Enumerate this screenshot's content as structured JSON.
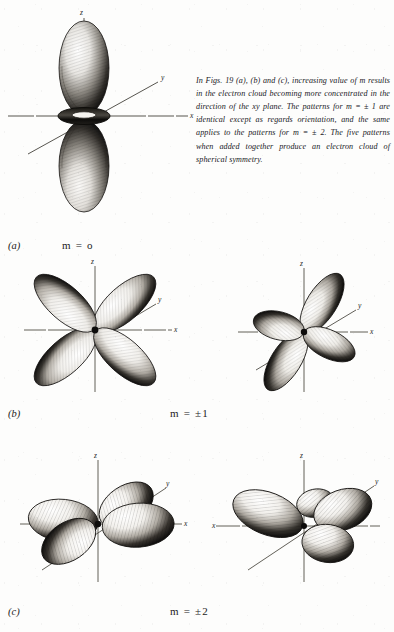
{
  "page": {
    "background_color": "#fdfdfc",
    "ink_color": "#1a1a1a"
  },
  "caption": {
    "text": "In Figs. 19 (a), (b) and (c), increasing value of m results in the electron cloud becoming more concentrated in the direction of the xy plane. The patterns for m = ± 1 are identical except as regards orientation, and the same applies to the patterns for m = ± 2. The five patterns when added together produce an electron cloud of spherical symmetry."
  },
  "rows": [
    {
      "panel_label": "(a)",
      "m_label": "m = o",
      "orbital_name": "d-z-squared",
      "diagrams": [
        {
          "name": "orbital-m0-dz2",
          "axes": {
            "z": "z",
            "y": "y",
            "x": "x"
          },
          "description": "Two large vertical lobes along z with a torus ring at the origin"
        }
      ]
    },
    {
      "panel_label": "(b)",
      "m_label": "m = ±1",
      "orbital_name": "d-xz-and-d-yz",
      "diagrams": [
        {
          "name": "orbital-m1-dxz",
          "axes": {
            "z": "z",
            "y": "y",
            "x": "x"
          },
          "description": "Four lobes in the xz plane, cloverleaf between z and x axes"
        },
        {
          "name": "orbital-m1-dyz",
          "axes": {
            "z": "z",
            "y": "y",
            "x": "x"
          },
          "description": "Four lobes in the yz plane, cloverleaf between z and y axes"
        }
      ]
    },
    {
      "panel_label": "(c)",
      "m_label": "m = ±2",
      "orbital_name": "d-x2-y2-and-d-xy",
      "diagrams": [
        {
          "name": "orbital-m2-dx2y2",
          "axes": {
            "z": "z",
            "y": "y",
            "x": "x"
          },
          "description": "Four flattened lobes lying in the xy plane along the x and y axes"
        },
        {
          "name": "orbital-m2-dxy",
          "axes": {
            "z": "z",
            "y": "y",
            "x": "x"
          },
          "description": "Four flattened lobes lying in the xy plane between the x and y axes"
        }
      ]
    }
  ]
}
